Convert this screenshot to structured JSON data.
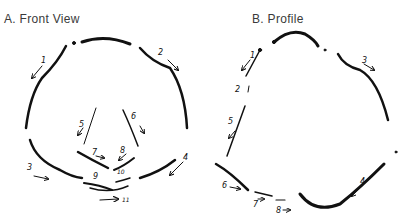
{
  "panels": [
    {
      "id": "A",
      "title": "A.  Front View",
      "labels": [
        "1",
        "2",
        "3",
        "4",
        "5",
        "6",
        "7",
        "8",
        "9",
        "10",
        "11"
      ]
    },
    {
      "id": "B",
      "title": "B.  Profile",
      "labels": [
        "1",
        "2",
        "3",
        "4",
        "5",
        "6",
        "7",
        "8"
      ]
    }
  ],
  "stroke_color": "#111111"
}
